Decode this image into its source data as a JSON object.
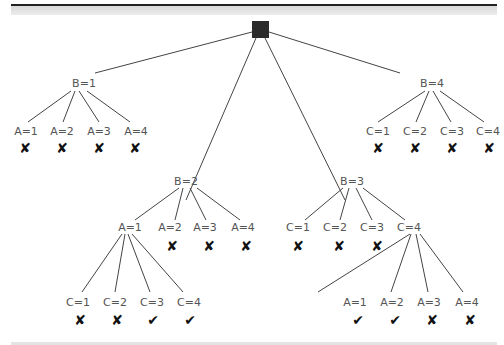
{
  "diagram": {
    "type": "search-tree",
    "root": {
      "label": ""
    },
    "glyphs": {
      "fail": "✘",
      "success": "✔"
    },
    "level1": [
      {
        "label": "B=1",
        "children": [
          {
            "label": "A=1",
            "result": "✘"
          },
          {
            "label": "A=2",
            "result": "✘"
          },
          {
            "label": "A=3",
            "result": "✘"
          },
          {
            "label": "A=4",
            "result": "✘"
          }
        ]
      },
      {
        "label": "B=2",
        "children": [
          {
            "label": "A=1",
            "result": "",
            "children": [
              {
                "label": "C=1",
                "result": "✘"
              },
              {
                "label": "C=2",
                "result": "✘"
              },
              {
                "label": "C=3",
                "result": "✔"
              },
              {
                "label": "C=4",
                "result": "✔"
              }
            ]
          },
          {
            "label": "A=2",
            "result": "✘"
          },
          {
            "label": "A=3",
            "result": "✘"
          },
          {
            "label": "A=4",
            "result": "✘"
          }
        ]
      },
      {
        "label": "B=3",
        "children": [
          {
            "label": "C=1",
            "result": "✘"
          },
          {
            "label": "C=2",
            "result": "✘"
          },
          {
            "label": "C=3",
            "result": "✘"
          },
          {
            "label": "C=4",
            "result": "",
            "children": [
              {
                "label": "A=1",
                "result": "✔"
              },
              {
                "label": "A=2",
                "result": "✔"
              },
              {
                "label": "A=3",
                "result": "✘"
              },
              {
                "label": "A=4",
                "result": "✘"
              }
            ]
          }
        ]
      },
      {
        "label": "B=4",
        "children": [
          {
            "label": "C=1",
            "result": "✘"
          },
          {
            "label": "C=2",
            "result": "✘"
          },
          {
            "label": "C=3",
            "result": "✘"
          },
          {
            "label": "C=4",
            "result": "✘"
          }
        ]
      }
    ]
  }
}
